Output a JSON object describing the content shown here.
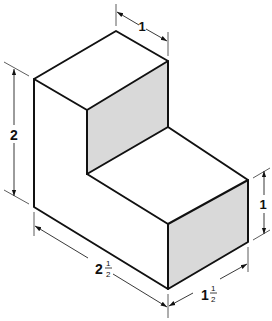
{
  "figure": {
    "type": "isometric-drawing",
    "colors": {
      "edge": "#111111",
      "shaded_face": "#d9d9d9",
      "background": "#ffffff"
    },
    "dimensions": {
      "top_depth": {
        "whole": "1",
        "label": "1"
      },
      "overall_height": {
        "whole": "2",
        "label": "2"
      },
      "step_height": {
        "whole": "1",
        "label": "1"
      },
      "overall_length": {
        "whole": "2",
        "num": "1",
        "den": "2",
        "label": "2 1/2"
      },
      "width": {
        "whole": "1",
        "num": "1",
        "den": "2",
        "label": "1 1/2"
      }
    }
  }
}
